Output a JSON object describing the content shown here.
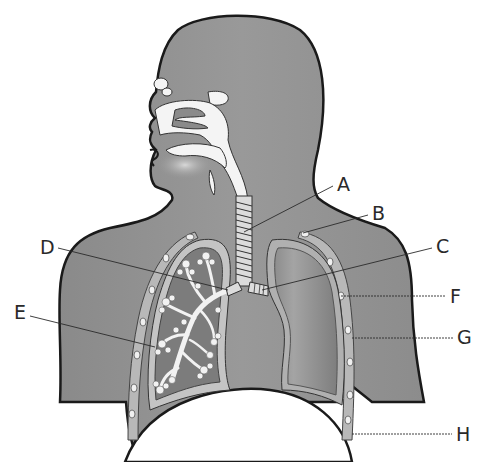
{
  "diagram": {
    "colors": {
      "body_fill": "#8e8e8e",
      "outline": "#1a1a1a",
      "airway_fill": "#f4f4f4",
      "lung_fill": "#7d7d7d",
      "pleura_fill": "#b8b8b8",
      "label_color": "#2a2a2a"
    },
    "labels": [
      {
        "id": "A",
        "text": "A",
        "x": 337,
        "y": 175,
        "target": "trachea"
      },
      {
        "id": "B",
        "text": "B",
        "x": 372,
        "y": 204,
        "target": "rib"
      },
      {
        "id": "C",
        "text": "C",
        "x": 436,
        "y": 237,
        "target": "bronchus"
      },
      {
        "id": "D",
        "text": "D",
        "x": 40,
        "y": 238,
        "target": "bronchioles"
      },
      {
        "id": "E",
        "text": "E",
        "x": 14,
        "y": 303,
        "target": "alveoli"
      },
      {
        "id": "F",
        "text": "F",
        "x": 450,
        "y": 287,
        "target": "intercostal muscle"
      },
      {
        "id": "G",
        "text": "G",
        "x": 457,
        "y": 328,
        "target": "pleural membrane"
      },
      {
        "id": "H",
        "text": "H",
        "x": 456,
        "y": 425,
        "target": "diaphragm"
      }
    ]
  }
}
